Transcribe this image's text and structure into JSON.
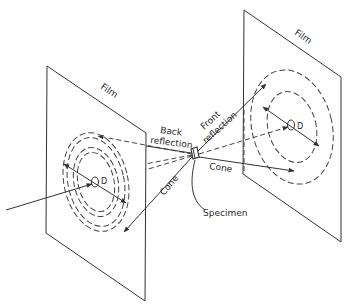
{
  "diagram": {
    "type": "X-ray diffraction geometry (transmission and back-reflection films)",
    "labels": {
      "film_left": "Film",
      "film_right": "Film",
      "back_reflection_1": "Back",
      "back_reflection_2": "reflection",
      "front_reflection_1": "Front",
      "front_reflection_2": "reflection",
      "cone_left": "Cone",
      "cone_right": "Cone",
      "specimen": "Specimen",
      "d_left": "D",
      "d_right": "D"
    },
    "components": [
      {
        "name": "back-reflection film",
        "position": "left"
      },
      {
        "name": "specimen",
        "position": "center"
      },
      {
        "name": "transmission film",
        "position": "right"
      },
      {
        "name": "incident beam",
        "from": "left edge",
        "through": "left film hole",
        "to": "specimen"
      },
      {
        "name": "diffraction cones",
        "count": 2,
        "rings_per_film": 2
      }
    ]
  }
}
